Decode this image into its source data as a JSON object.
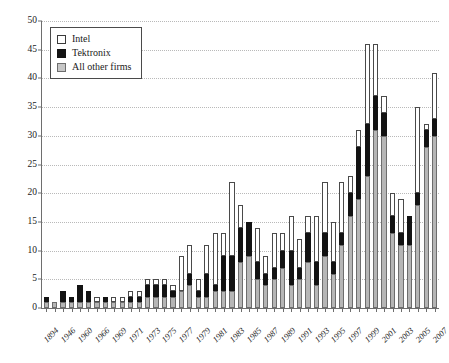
{
  "chart_data": {
    "type": "bar",
    "stacked": true,
    "title": "",
    "subtitle": "",
    "xlabel": "",
    "ylabel": "",
    "ylim": [
      0,
      50
    ],
    "ytick_step": 5,
    "yticks": [
      0,
      5,
      10,
      15,
      20,
      25,
      30,
      35,
      40,
      45,
      50
    ],
    "ytick_labels": [
      "0",
      "5",
      "10",
      "15",
      "20",
      "25",
      "30",
      "35",
      "40",
      "45",
      "50"
    ],
    "grid": true,
    "grid_axis": "y",
    "legend_position": "top-left",
    "legend": [
      {
        "name": "Intel",
        "color": "#ffffff",
        "edge": "#4a4a4a"
      },
      {
        "name": "Tektronix",
        "color": "#131313",
        "edge": "#131313"
      },
      {
        "name": "All other firms",
        "color": "#b6b6b6",
        "edge": "#6d6d6d"
      }
    ],
    "categories": [
      "1894",
      "1945",
      "1946",
      "1959",
      "1960",
      "1965",
      "1966",
      "1968",
      "1969",
      "1970",
      "1971",
      "1972",
      "1973",
      "1974",
      "1975",
      "1976",
      "1977",
      "1978",
      "1979",
      "1980",
      "1981",
      "1982",
      "1983",
      "1984",
      "1985",
      "1986",
      "1987",
      "1988",
      "1989",
      "1990",
      "1991",
      "1992",
      "1993",
      "1994",
      "1995",
      "1996",
      "1997",
      "1998",
      "1999",
      "2000",
      "2001",
      "2002",
      "2003",
      "2004",
      "2005",
      "2006",
      "2007"
    ],
    "xtick_labels": [
      "1894",
      "",
      "1946",
      "",
      "1960",
      "",
      "1966",
      "",
      "1969",
      "",
      "1971",
      "",
      "1973",
      "",
      "1975",
      "",
      "1977",
      "",
      "1979",
      "",
      "1981",
      "",
      "1983",
      "",
      "1985",
      "",
      "1987",
      "",
      "1989",
      "",
      "1991",
      "",
      "1993",
      "",
      "1995",
      "",
      "1997",
      "",
      "1999",
      "",
      "2001",
      "",
      "2003",
      "",
      "2005",
      "",
      "2007"
    ],
    "series": [
      {
        "name": "All other firms",
        "values": [
          1,
          1,
          1,
          1,
          1,
          1,
          1,
          1,
          1,
          1,
          1,
          1,
          2,
          2,
          2,
          2,
          3,
          4,
          2,
          2,
          3,
          3,
          3,
          8,
          9,
          5,
          4,
          5,
          7,
          4,
          5,
          8,
          4,
          9,
          6,
          11,
          16,
          19,
          23,
          31,
          30,
          13,
          11,
          11,
          18,
          28,
          30
        ]
      },
      {
        "name": "Tektronix",
        "values": [
          1,
          0,
          2,
          1,
          3,
          2,
          0,
          1,
          0,
          0,
          1,
          1,
          2,
          2,
          2,
          1,
          0,
          2,
          1,
          4,
          1,
          6,
          6,
          6,
          6,
          3,
          2,
          2,
          3,
          6,
          2,
          5,
          4,
          4,
          2,
          2,
          4,
          9,
          9,
          6,
          4,
          3,
          2,
          5,
          2,
          3,
          3
        ]
      },
      {
        "name": "Intel",
        "values": [
          0,
          0,
          0,
          0,
          0,
          0,
          1,
          0,
          1,
          1,
          1,
          1,
          1,
          1,
          1,
          1,
          6,
          5,
          2,
          5,
          9,
          4,
          13,
          4,
          0,
          6,
          3,
          6,
          3,
          6,
          5,
          3,
          8,
          9,
          7,
          9,
          3,
          3,
          14,
          9,
          3,
          4,
          6,
          0,
          15,
          1,
          8
        ]
      }
    ],
    "totals": [
      2,
      1,
      3,
      2,
      4,
      3,
      2,
      2,
      2,
      2,
      3,
      3,
      5,
      5,
      5,
      4,
      9,
      11,
      5,
      11,
      13,
      13,
      22,
      18,
      15,
      14,
      9,
      13,
      13,
      16,
      12,
      16,
      16,
      22,
      15,
      22,
      23,
      31,
      46,
      46,
      37,
      20,
      19,
      16,
      35,
      32,
      41
    ]
  }
}
